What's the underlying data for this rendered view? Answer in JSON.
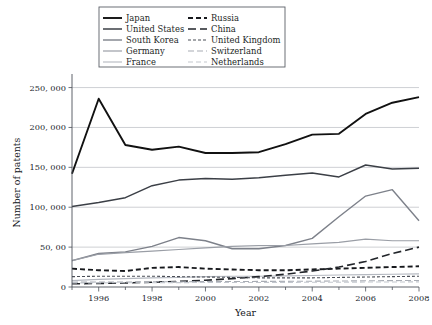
{
  "chart_data": {
    "type": "line",
    "title": "",
    "xlabel": "Year",
    "ylabel": "Number of patents",
    "x": [
      1995,
      1996,
      1997,
      1998,
      1999,
      2000,
      2001,
      2002,
      2003,
      2004,
      2005,
      2006,
      2007,
      2008
    ],
    "xtick_labels": [
      "1996",
      "1998",
      "2000",
      "2002",
      "2004",
      "2006",
      "2008"
    ],
    "xticks": [
      1996,
      1998,
      2000,
      2002,
      2004,
      2006,
      2008
    ],
    "xlim": [
      1995,
      2008
    ],
    "ytick_labels": [
      "0",
      "50, 00",
      "100, 000",
      "150, 000",
      "200, 000",
      "250, 000"
    ],
    "yticks": [
      0,
      50000,
      100000,
      150000,
      200000,
      250000
    ],
    "ylim": [
      0,
      262000
    ],
    "grid": "horizontal",
    "legend_position": "top-center",
    "series": [
      {
        "name": "Japan",
        "color": "#111111",
        "width": 1.9,
        "dash": "none",
        "values": [
          142000,
          236000,
          178000,
          172000,
          176000,
          168000,
          168000,
          169000,
          179000,
          191000,
          192000,
          217000,
          231000,
          238000
        ]
      },
      {
        "name": "United States",
        "color": "#3b3f46",
        "width": 1.5,
        "dash": "none",
        "values": [
          101000,
          106000,
          112000,
          127000,
          134000,
          136000,
          135000,
          137000,
          140000,
          143000,
          138000,
          153000,
          148000,
          149000
        ]
      },
      {
        "name": "South Korea",
        "color": "#7d818a",
        "width": 1.4,
        "dash": "none",
        "values": [
          33000,
          42000,
          44000,
          51000,
          62000,
          58000,
          48000,
          48000,
          52000,
          61000,
          88000,
          114000,
          122000,
          83000
        ]
      },
      {
        "name": "Germany",
        "color": "#9a9ea6",
        "width": 1.2,
        "dash": "none",
        "values": [
          33000,
          41000,
          43000,
          45000,
          47000,
          49000,
          51000,
          52000,
          52000,
          54000,
          56000,
          60000,
          58000,
          58000
        ]
      },
      {
        "name": "France",
        "color": "#b4b8c0",
        "width": 1.1,
        "dash": "none",
        "values": [
          8000,
          9500,
          10500,
          11500,
          12000,
          13000,
          13500,
          13500,
          14000,
          14500,
          15000,
          15500,
          16000,
          16500
        ]
      },
      {
        "name": "Russia",
        "color": "#17191d",
        "width": 1.9,
        "dash": "5,3",
        "values": [
          23000,
          21000,
          20000,
          24000,
          25000,
          23000,
          22000,
          21000,
          21000,
          22000,
          23000,
          24000,
          25000,
          26000
        ]
      },
      {
        "name": "China",
        "color": "#22252a",
        "width": 1.6,
        "dash": "8,4",
        "values": [
          4000,
          4500,
          5000,
          6000,
          7000,
          8500,
          10500,
          13000,
          16000,
          20000,
          25000,
          32000,
          42000,
          50000
        ]
      },
      {
        "name": "United Kingdom",
        "color": "#4a4e56",
        "width": 1.1,
        "dash": "3,2",
        "values": [
          13000,
          13500,
          13500,
          13500,
          13000,
          12500,
          12000,
          11500,
          11500,
          11500,
          12000,
          12500,
          13000,
          13500
        ]
      },
      {
        "name": "Switzerland",
        "color": "#a8acb4",
        "width": 1.1,
        "dash": "6,3",
        "values": [
          6000,
          6200,
          6300,
          6500,
          6600,
          6800,
          6900,
          7000,
          7100,
          7300,
          7500,
          7800,
          8000,
          8200
        ]
      },
      {
        "name": "Netherlands",
        "color": "#c3c7ce",
        "width": 1.1,
        "dash": "5,3",
        "values": [
          5000,
          5200,
          5300,
          5400,
          5500,
          5600,
          5600,
          5700,
          5800,
          5900,
          6000,
          6200,
          6300,
          6400
        ]
      }
    ]
  },
  "plot": {
    "left": 72,
    "right": 419,
    "top": 78,
    "bottom": 287
  },
  "legend": {
    "box": {
      "x": 99,
      "y": 7,
      "width": 186,
      "height": 60
    },
    "col1_sample_x1": 103,
    "col1_sample_x2": 122,
    "col1_text_x": 126,
    "col2_sample_x1": 188,
    "col2_sample_x2": 207,
    "col2_text_x": 211,
    "row_start_y": 18,
    "row_step": 11
  }
}
